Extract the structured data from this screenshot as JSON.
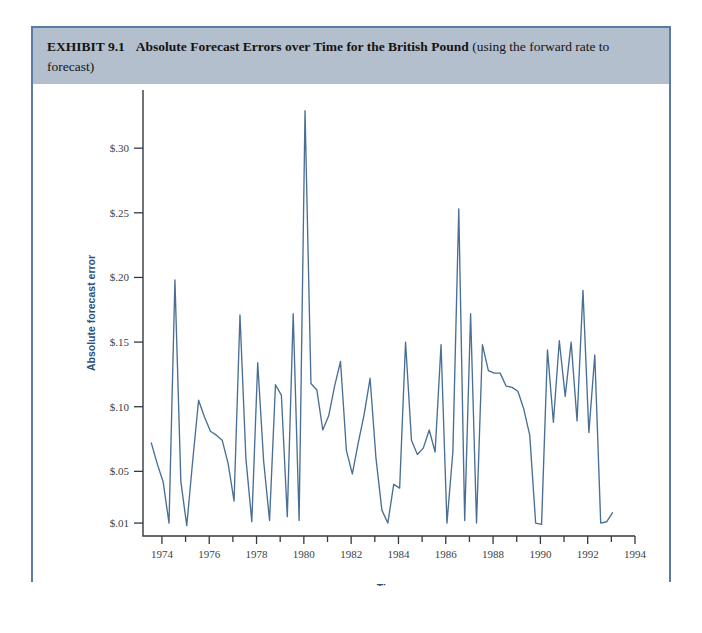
{
  "exhibit": {
    "label": "EXHIBIT 9.1",
    "title_bold": "Absolute Forecast Errors over Time for the British Pound",
    "title_normal": " (using the forward rate to forecast)"
  },
  "colors": {
    "header_band": "#b3bfcd",
    "frame_border": "#5b7ba3",
    "line": "#4a6f96",
    "axis": "#333a40",
    "axis_title": "#2d4f7c"
  },
  "chart_data": {
    "type": "line",
    "title": "Absolute Forecast Errors over Time for the British Pound",
    "xlabel": "Time",
    "ylabel": "Absolute forecast error",
    "grid": false,
    "legend": "none",
    "xlim": [
      1973.2,
      1994.0
    ],
    "ylim": [
      0.0,
      0.345
    ],
    "xticks": [
      1974,
      1976,
      1978,
      1980,
      1982,
      1984,
      1986,
      1988,
      1990,
      1992,
      1994
    ],
    "xtick_labels": [
      "1974",
      "1976",
      "1978",
      "1980",
      "1982",
      "1984",
      "1986",
      "1988",
      "1990",
      "1992",
      "1994"
    ],
    "xticks_minor": [
      1975,
      1977,
      1979,
      1981,
      1983,
      1985,
      1987,
      1989,
      1991,
      1993
    ],
    "yticks": [
      0.01,
      0.05,
      0.1,
      0.15,
      0.2,
      0.25,
      0.3
    ],
    "ytick_labels": [
      "$.01",
      "$.05",
      "$.10",
      "$.15",
      "$.20",
      "$.25",
      "$.30"
    ],
    "series": [
      {
        "name": "Absolute forecast error",
        "x": [
          1973.55,
          1973.8,
          1974.05,
          1974.3,
          1974.55,
          1974.8,
          1975.05,
          1975.3,
          1975.55,
          1975.8,
          1976.05,
          1976.3,
          1976.55,
          1976.8,
          1977.05,
          1977.3,
          1977.55,
          1977.8,
          1978.05,
          1978.3,
          1978.55,
          1978.8,
          1979.05,
          1979.3,
          1979.55,
          1979.8,
          1980.05,
          1980.3,
          1980.55,
          1980.8,
          1981.05,
          1981.3,
          1981.55,
          1981.8,
          1982.05,
          1982.3,
          1982.55,
          1982.8,
          1983.05,
          1983.3,
          1983.55,
          1983.8,
          1984.05,
          1984.3,
          1984.55,
          1984.8,
          1985.05,
          1985.3,
          1985.55,
          1985.8,
          1986.05,
          1986.3,
          1986.55,
          1986.8,
          1987.05,
          1987.3,
          1987.55,
          1987.8,
          1988.05,
          1988.3,
          1988.55,
          1988.8,
          1989.05,
          1989.3,
          1989.55,
          1989.8,
          1990.05,
          1990.3,
          1990.55,
          1990.8,
          1991.05,
          1991.3,
          1991.55,
          1991.8,
          1992.05,
          1992.3,
          1992.55,
          1992.8,
          1993.05
        ],
        "values": [
          0.072,
          0.056,
          0.042,
          0.01,
          0.198,
          0.042,
          0.008,
          0.058,
          0.105,
          0.092,
          0.081,
          0.078,
          0.074,
          0.056,
          0.027,
          0.171,
          0.06,
          0.011,
          0.134,
          0.058,
          0.012,
          0.117,
          0.109,
          0.015,
          0.172,
          0.012,
          0.329,
          0.118,
          0.113,
          0.082,
          0.093,
          0.116,
          0.135,
          0.066,
          0.048,
          0.072,
          0.094,
          0.122,
          0.06,
          0.02,
          0.01,
          0.04,
          0.037,
          0.15,
          0.074,
          0.063,
          0.068,
          0.082,
          0.065,
          0.148,
          0.01,
          0.065,
          0.253,
          0.012,
          0.172,
          0.01,
          0.148,
          0.128,
          0.126,
          0.126,
          0.116,
          0.115,
          0.112,
          0.098,
          0.078,
          0.01,
          0.009,
          0.144,
          0.088,
          0.151,
          0.108,
          0.15,
          0.089,
          0.19,
          0.08,
          0.14,
          0.01,
          0.011,
          0.018
        ]
      }
    ]
  }
}
